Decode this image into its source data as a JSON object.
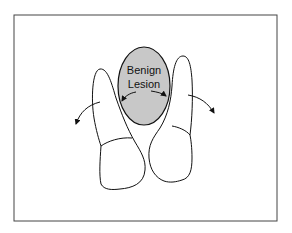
{
  "diagram": {
    "label_line1": "Benign",
    "label_line2": "Lesion",
    "colors": {
      "frame": "#444444",
      "outline": "#111111",
      "lesion_fill": "#c8c8c8"
    }
  }
}
